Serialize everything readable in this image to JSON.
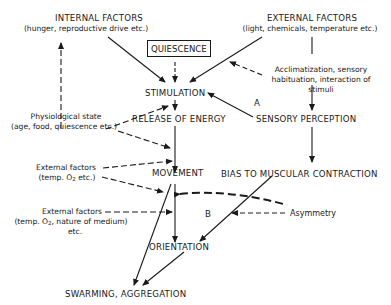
{
  "nodes": {
    "internal_factors": {
      "title": "INTERNAL FACTORS",
      "subtitle": "(hunger, reproductive drive etc.)"
    },
    "external_factors": {
      "title": "EXTERNAL FACTORS",
      "subtitle": "(light, chemicals, temperature etc.)"
    },
    "quiescence": "QUIESCENCE",
    "stimulation": "STIMULATION",
    "release_of_energy": "RELEASE OF ENERGY",
    "sensory_perception": "SENSORY PERCEPTION",
    "movement": "MOVEMENT",
    "bias": "BIAS TO MUSCULAR CONTRACTION",
    "orientation": "ORIENTATION",
    "swarming": "SWARMING, AGGREGATION"
  },
  "modifiers": {
    "acclimatization": [
      "Acclimatization, sensory",
      "habituation, interaction of",
      "stimuli"
    ],
    "physiological_state": [
      "Physiological state",
      "(age, food, quiescence etc.)"
    ],
    "external_factors_1": [
      "External factors",
      "(temp. O",
      "2",
      " etc.)"
    ],
    "external_factors_2": [
      "External factors",
      "(temp. O",
      "2",
      ", nature of medium)",
      "etc."
    ],
    "asymmetry": "Asymmetry"
  },
  "pathway_labels": {
    "a": "A",
    "b": "B"
  }
}
